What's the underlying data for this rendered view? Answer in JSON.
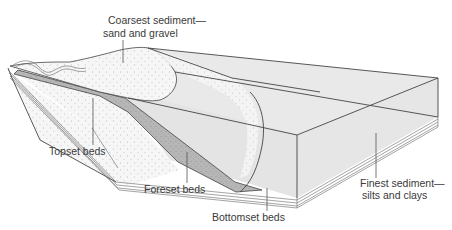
{
  "figure": {
    "colors": {
      "background": "#ffffff",
      "water_body": "#e8e8e8",
      "coarse_sand": "#f4f4f4",
      "foreset": "#b9b9b9",
      "line": "#444444",
      "text": "#3a3a3a"
    }
  },
  "labels": {
    "coarsest": {
      "line1": "Coarsest sediment—",
      "line2": "sand and gravel"
    },
    "topset": {
      "text": "Topset beds"
    },
    "foreset": {
      "text": "Foreset beds"
    },
    "bottomset": {
      "text": "Bottomset beds"
    },
    "finest": {
      "line1": "Finest sediment—",
      "line2": "silts and clays"
    }
  }
}
